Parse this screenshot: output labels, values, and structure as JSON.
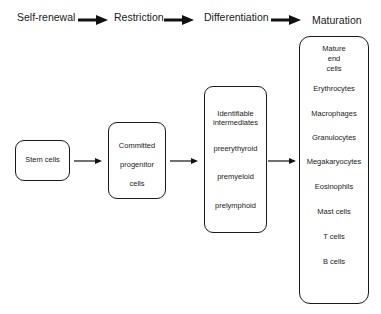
{
  "stages": [
    "Self-renewal",
    "Restriction",
    "Differentiation",
    "Maturation"
  ],
  "boxes": {
    "stem": "Stem cells",
    "progenitor": [
      "Committed",
      "progenitor",
      "cells"
    ],
    "intermediates": {
      "title": [
        "Identifiable",
        "intermediates"
      ],
      "items": [
        "preerythyroid",
        "premyeloid",
        "prelymphoid"
      ]
    },
    "mature": {
      "title": [
        "Mature",
        "end",
        "cells"
      ],
      "items": [
        "Erythrocytes",
        "Macrophages",
        "Granulocytes",
        "Megakaryocytes",
        "Eosinophils",
        "Mast cells",
        "T cells",
        "B cells"
      ]
    }
  }
}
